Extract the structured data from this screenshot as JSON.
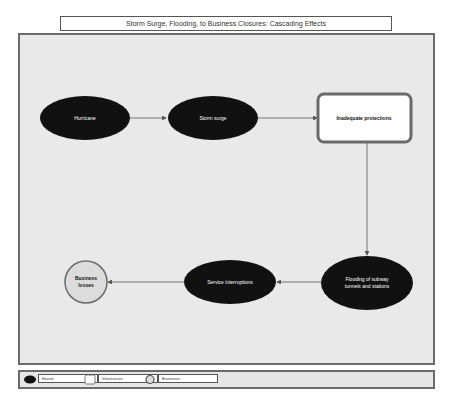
{
  "title": "Storm Surge, Flooding, to Business Closures: Cascading Effects",
  "colors": {
    "hazard_fill": "#111111",
    "infrastructure_fill": "#ffffff",
    "infrastructure_border": "#6a6a6a",
    "business_fill": "#dcdcdc",
    "business_border": "#6a6a6a",
    "panel_bg": "#e9e9e9",
    "arrow": "#555555"
  },
  "nodes": [
    {
      "id": "hurricane",
      "label": "Hurricane",
      "type": "hazard"
    },
    {
      "id": "storm_surge",
      "label": "Storm surge",
      "type": "hazard"
    },
    {
      "id": "inadequate_protections",
      "label": "Inadequate protections",
      "type": "infrastructure"
    },
    {
      "id": "flooding",
      "label_line1": "Flooding of subway",
      "label_line2": "tunnels and stations",
      "type": "hazard"
    },
    {
      "id": "service_interruptions",
      "label": "Service interruptions",
      "type": "hazard"
    },
    {
      "id": "business_losses",
      "label_line1": "Business",
      "label_line2": "losses",
      "type": "business"
    }
  ],
  "edges": [
    {
      "from": "hurricane",
      "to": "storm_surge"
    },
    {
      "from": "storm_surge",
      "to": "inadequate_protections"
    },
    {
      "from": "inadequate_protections",
      "to": "flooding"
    },
    {
      "from": "flooding",
      "to": "service_interruptions"
    },
    {
      "from": "service_interruptions",
      "to": "business_losses"
    }
  ],
  "legend": [
    {
      "shape": "ellipse",
      "label": "Hazard"
    },
    {
      "shape": "rounded-square",
      "label": "Infrastructure"
    },
    {
      "shape": "circle",
      "label": "Businesses"
    }
  ]
}
